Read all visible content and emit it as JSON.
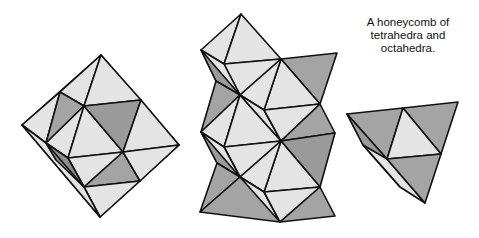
{
  "caption": {
    "lines": [
      "A honeycomb of",
      "tetrahedra and",
      "octahedra."
    ]
  },
  "colors": {
    "light": "#e4e4e4",
    "gray": "#a4a4a4",
    "dark": "#8e8e8e",
    "stroke": "#111111"
  },
  "figures": [
    {
      "name": "octahedron",
      "label": ""
    },
    {
      "name": "honeycomb-stack",
      "label": ""
    },
    {
      "name": "tetrahedron",
      "label": ""
    }
  ]
}
